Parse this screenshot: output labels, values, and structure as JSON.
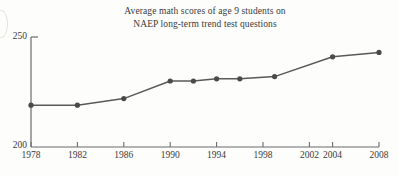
{
  "chart_data": {
    "type": "line",
    "title": "Average math scores of age 9 students on NAEP long-term trend test questions",
    "title_line1": "Average math scores of age 9 students on",
    "title_line2": "NAEP long-term trend test questions",
    "xlabel": "",
    "ylabel": "",
    "xlim": [
      1978,
      2008
    ],
    "ylim": [
      200,
      250
    ],
    "grid": false,
    "legend": "none",
    "y_ticks": [
      200,
      250
    ],
    "y_tick_labels": [
      "200",
      "250"
    ],
    "x_ticks": [
      1978,
      1982,
      1986,
      1990,
      1994,
      1998,
      2002,
      2004,
      2008
    ],
    "x_tick_labels": [
      "1978",
      "1982",
      "1986",
      "1990",
      "1994",
      "1998",
      "2002",
      "2004",
      "2008"
    ],
    "x": [
      1978,
      1982,
      1986,
      1990,
      1992,
      1994,
      1996,
      1999,
      2004,
      2008
    ],
    "values": [
      219,
      219,
      222,
      230,
      230,
      231,
      231,
      232,
      241,
      243
    ],
    "marker": "circle",
    "series": [
      {
        "name": "Average math score, age 9",
        "points": [
          {
            "year": 1978,
            "score": 219
          },
          {
            "year": 1982,
            "score": 219
          },
          {
            "year": 1986,
            "score": 222
          },
          {
            "year": 1990,
            "score": 230
          },
          {
            "year": 1992,
            "score": 230
          },
          {
            "year": 1994,
            "score": 231
          },
          {
            "year": 1996,
            "score": 231
          },
          {
            "year": 1999,
            "score": 232
          },
          {
            "year": 2004,
            "score": 241
          },
          {
            "year": 2008,
            "score": 243
          }
        ]
      }
    ],
    "colors": {
      "line": "#595959",
      "marker": "#4a4a4a",
      "axis": "#6b6b6b",
      "text": "#3a3a3a",
      "background": "#fdfdfc"
    }
  }
}
